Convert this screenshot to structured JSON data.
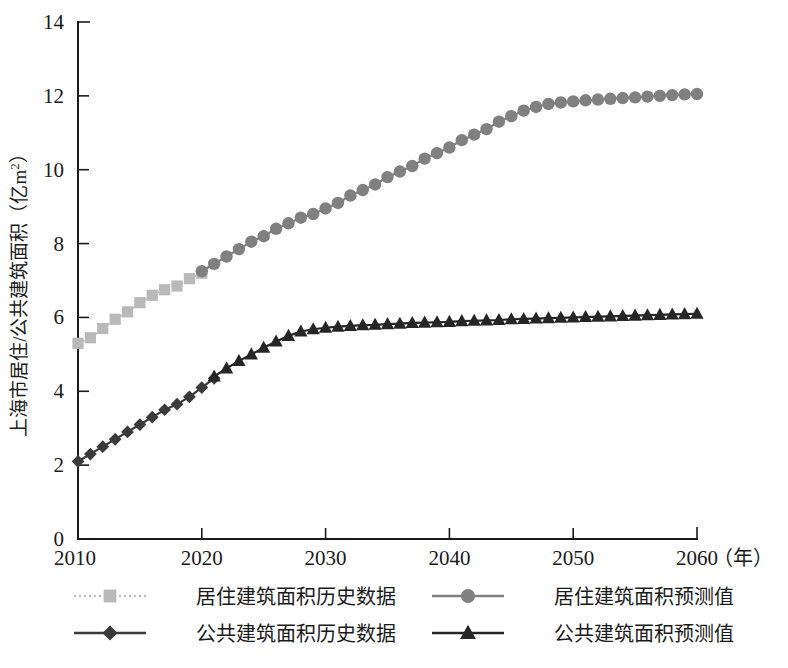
{
  "chart_data": {
    "type": "line",
    "title": "",
    "xlabel": "年",
    "ylabel": "上海市居住/公共建筑面积（亿m²）",
    "ylabel_parts": [
      "上海市居住/公共建筑面积（亿m",
      "2",
      "）"
    ],
    "xlim": [
      2010,
      2060
    ],
    "ylim": [
      0,
      14
    ],
    "xticks": [
      2010,
      2020,
      2030,
      2040,
      2050,
      2060
    ],
    "yticks": [
      0,
      2,
      4,
      6,
      8,
      10,
      12,
      14
    ],
    "xtick_labels": [
      "2010",
      "2020",
      "2030",
      "2040",
      "2050",
      "2060"
    ],
    "ytick_labels": [
      "0",
      "2",
      "4",
      "6",
      "8",
      "10",
      "12",
      "14"
    ],
    "x_unit_suffix": "（年）",
    "grid": false,
    "legend_position": "below",
    "series": [
      {
        "name": "居住建筑面积历史数据",
        "key": "residential_history",
        "marker": "square",
        "color": "#b9b9b9",
        "line_style": "dotted",
        "x": [
          2010,
          2011,
          2012,
          2013,
          2014,
          2015,
          2016,
          2017,
          2018,
          2019,
          2020
        ],
        "values": [
          5.3,
          5.45,
          5.7,
          5.95,
          6.15,
          6.4,
          6.6,
          6.75,
          6.85,
          7.05,
          7.2
        ]
      },
      {
        "name": "居住建筑面积预测值",
        "key": "residential_forecast",
        "marker": "circle",
        "color": "#808080",
        "line_style": "solid",
        "x": [
          2020,
          2021,
          2022,
          2023,
          2024,
          2025,
          2026,
          2027,
          2028,
          2029,
          2030,
          2031,
          2032,
          2033,
          2034,
          2035,
          2036,
          2037,
          2038,
          2039,
          2040,
          2041,
          2042,
          2043,
          2044,
          2045,
          2046,
          2047,
          2048,
          2049,
          2050,
          2051,
          2052,
          2053,
          2054,
          2055,
          2056,
          2057,
          2058,
          2059,
          2060
        ],
        "values": [
          7.25,
          7.45,
          7.65,
          7.85,
          8.05,
          8.2,
          8.4,
          8.55,
          8.7,
          8.8,
          8.95,
          9.1,
          9.3,
          9.45,
          9.6,
          9.8,
          9.95,
          10.1,
          10.3,
          10.45,
          10.6,
          10.8,
          10.95,
          11.1,
          11.3,
          11.45,
          11.6,
          11.7,
          11.78,
          11.82,
          11.85,
          11.88,
          11.9,
          11.92,
          11.94,
          11.96,
          11.98,
          12.0,
          12.02,
          12.04,
          12.05
        ]
      },
      {
        "name": "公共建筑面积历史数据",
        "key": "public_history",
        "marker": "diamond",
        "color": "#3a3a3a",
        "line_style": "solid",
        "x": [
          2010,
          2011,
          2012,
          2013,
          2014,
          2015,
          2016,
          2017,
          2018,
          2019,
          2020,
          2021
        ],
        "values": [
          2.1,
          2.3,
          2.5,
          2.7,
          2.9,
          3.1,
          3.3,
          3.5,
          3.65,
          3.85,
          4.1,
          4.35
        ]
      },
      {
        "name": "公共建筑面积预测值",
        "key": "public_forecast",
        "marker": "triangle",
        "color": "#262626",
        "line_style": "solid",
        "x": [
          2021,
          2022,
          2023,
          2024,
          2025,
          2026,
          2027,
          2028,
          2029,
          2030,
          2031,
          2032,
          2033,
          2034,
          2035,
          2036,
          2037,
          2038,
          2039,
          2040,
          2041,
          2042,
          2043,
          2044,
          2045,
          2046,
          2047,
          2048,
          2049,
          2050,
          2051,
          2052,
          2053,
          2054,
          2055,
          2056,
          2057,
          2058,
          2059,
          2060
        ],
        "values": [
          4.4,
          4.62,
          4.82,
          5.0,
          5.18,
          5.35,
          5.5,
          5.62,
          5.68,
          5.72,
          5.75,
          5.77,
          5.79,
          5.8,
          5.82,
          5.83,
          5.85,
          5.86,
          5.87,
          5.88,
          5.9,
          5.91,
          5.92,
          5.93,
          5.95,
          5.96,
          5.97,
          5.98,
          5.99,
          6.0,
          6.01,
          6.02,
          6.03,
          6.04,
          6.05,
          6.06,
          6.07,
          6.08,
          6.09,
          6.1
        ]
      }
    ],
    "legend": [
      {
        "label": "居住建筑面积历史数据",
        "marker": "square",
        "color": "#b9b9b9",
        "line_style": "dotted"
      },
      {
        "label": "居住建筑面积预测值",
        "marker": "circle",
        "color": "#808080",
        "line_style": "solid"
      },
      {
        "label": "公共建筑面积历史数据",
        "marker": "diamond",
        "color": "#3a3a3a",
        "line_style": "solid"
      },
      {
        "label": "公共建筑面积预测值",
        "marker": "triangle",
        "color": "#262626",
        "line_style": "solid"
      }
    ]
  }
}
